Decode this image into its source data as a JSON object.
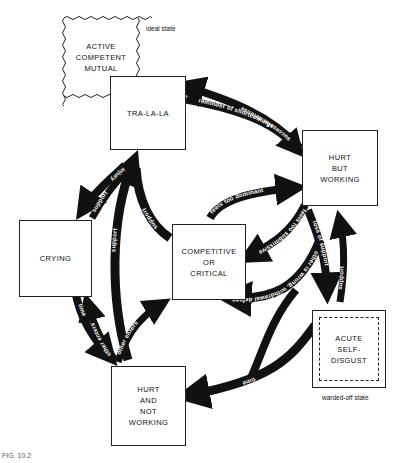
{
  "nodes": {
    "ideal": {
      "label": "ACTIVE\nCOMPETENT\nMUTUAL",
      "note": "ideal state"
    },
    "tralala": {
      "label": "TRA-LA-LA"
    },
    "hurt_working": {
      "label": "HURT\nBUT\nWORKING"
    },
    "crying": {
      "label": "CRYING"
    },
    "competitive": {
      "label": "COMPETITIVE\nOR\nCRITICAL"
    },
    "self_disgust": {
      "label": "ACUTE\nSELF-\nDISGUST",
      "note": "warded-off state"
    },
    "hurt_not_working": {
      "label": "HURT\nAND\nNOT\nWORKING"
    }
  },
  "edges": [
    {
      "from": "hurt_working",
      "to": "tralala",
      "label": "successful defense"
    },
    {
      "from": "tralala",
      "to": "hurt_working",
      "label": "reminder of shortcomings"
    },
    {
      "from": "competitive",
      "to": "hurt_working",
      "label": "feels too dominant"
    },
    {
      "from": "hurt_working",
      "to": "competitive",
      "label": "feels too submissive"
    },
    {
      "from": "hurt_working",
      "to": "self_disgust",
      "label": "loss of support"
    },
    {
      "from": "self_disgust",
      "to": "hurt_working",
      "label": "support"
    },
    {
      "from": "hurt_working",
      "to": "competitive",
      "label": "other is wrong, withdrawal defense"
    },
    {
      "from": "self_disgust",
      "to": "hurt_not_working",
      "label": "time"
    },
    {
      "from": "tralala",
      "to": "crying",
      "label": "injury"
    },
    {
      "from": "crying",
      "to": "tralala",
      "label": "support"
    },
    {
      "from": "hurt_not_working",
      "to": "tralala",
      "label": "support"
    },
    {
      "from": "competitive",
      "to": "tralala",
      "label": "support"
    },
    {
      "from": "crying",
      "to": "hurt_not_working",
      "label": "time"
    },
    {
      "from": "hurt_not_working",
      "to": "crying",
      "label": "other enters"
    },
    {
      "from": "hurt_not_working",
      "to": "tralala",
      "label": "other enters"
    },
    {
      "from": "hurt_not_working",
      "to": "competitive",
      "label": "other enters"
    }
  ],
  "caption": "FIG. 10.2"
}
